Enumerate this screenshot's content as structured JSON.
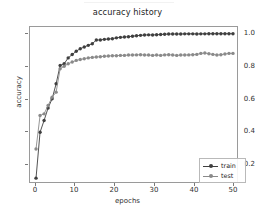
{
  "figure": {
    "title": "accuracy history",
    "background": "#ffffff"
  },
  "axes": {
    "xlabel": "epochs",
    "ylabel": "accuracy",
    "xticks": [
      "0",
      "10",
      "20",
      "30",
      "40",
      "50"
    ],
    "yticks": [
      "0.2",
      "0.4",
      "0.6",
      "0.8",
      "1.0"
    ]
  },
  "legend": {
    "train_label": "train",
    "test_label": "test"
  },
  "colors": {
    "train": "#3f3f3f",
    "test": "#8a8a8a",
    "axis": "#9a9a9a",
    "text": "#262626"
  },
  "chart_data": {
    "type": "line",
    "title": "accuracy history",
    "xlabel": "epochs",
    "ylabel": "accuracy",
    "xlim": [
      -1.5,
      50.5
    ],
    "ylim": [
      0.1,
      1.04
    ],
    "grid": false,
    "legend_position": "lower right",
    "marker": "circle",
    "x": [
      0,
      1,
      2,
      3,
      4,
      5,
      6,
      7,
      8,
      9,
      10,
      11,
      12,
      13,
      14,
      15,
      16,
      17,
      18,
      19,
      20,
      21,
      22,
      23,
      24,
      25,
      26,
      27,
      28,
      29,
      30,
      31,
      32,
      33,
      34,
      35,
      36,
      37,
      38,
      39,
      40,
      41,
      42,
      43,
      44,
      45,
      46,
      47,
      48,
      49
    ],
    "series": [
      {
        "name": "train",
        "color": "#3f3f3f",
        "values": [
          0.135,
          0.41,
          0.48,
          0.555,
          0.61,
          0.7,
          0.81,
          0.82,
          0.855,
          0.875,
          0.895,
          0.91,
          0.92,
          0.93,
          0.94,
          0.962,
          0.962,
          0.966,
          0.968,
          0.97,
          0.975,
          0.978,
          0.98,
          0.982,
          0.985,
          0.988,
          0.99,
          0.992,
          0.993,
          0.992,
          0.994,
          0.995,
          0.997,
          0.998,
          0.998,
          0.998,
          0.998,
          0.999,
          0.999,
          0.999,
          0.998,
          0.999,
          0.999,
          1.0,
          1.0,
          1.0,
          1.0,
          1.0,
          1.0,
          1.0
        ]
      },
      {
        "name": "test",
        "color": "#8a8a8a",
        "values": [
          0.31,
          0.51,
          0.52,
          0.57,
          0.62,
          0.65,
          0.79,
          0.805,
          0.82,
          0.83,
          0.84,
          0.845,
          0.85,
          0.855,
          0.858,
          0.86,
          0.862,
          0.865,
          0.866,
          0.868,
          0.868,
          0.87,
          0.87,
          0.872,
          0.872,
          0.873,
          0.874,
          0.872,
          0.872,
          0.87,
          0.872,
          0.87,
          0.873,
          0.874,
          0.872,
          0.87,
          0.872,
          0.872,
          0.873,
          0.874,
          0.876,
          0.882,
          0.884,
          0.88,
          0.876,
          0.872,
          0.874,
          0.878,
          0.882,
          0.882
        ]
      }
    ]
  }
}
